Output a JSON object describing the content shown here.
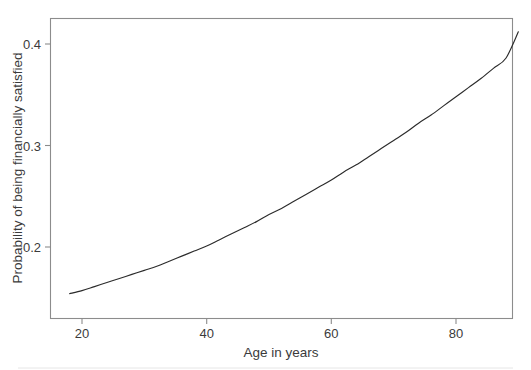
{
  "chart_data": {
    "type": "line",
    "title": "",
    "subtitle": "",
    "xlabel": "Age in years",
    "ylabel": "Probability of being financially satisfied",
    "xlim": [
      15,
      92
    ],
    "ylim": [
      0.143,
      0.427
    ],
    "xticks": [
      20,
      40,
      60,
      80
    ],
    "xtick_labels": [
      "20",
      "40",
      "60",
      "80"
    ],
    "yticks": [
      0.2,
      0.3,
      0.4
    ],
    "ytick_labels": [
      "0.2",
      "0.3",
      "0.4"
    ],
    "grid": false,
    "legend": null,
    "legend_position": "none",
    "annotations": [],
    "series": [
      {
        "name": "Predicted probability",
        "color": "#2b2b2b",
        "x": [
          18,
          20,
          22,
          24,
          26,
          28,
          30,
          32,
          34,
          36,
          38,
          40,
          42,
          44,
          46,
          48,
          50,
          52,
          54,
          56,
          58,
          60,
          62,
          64,
          66,
          68,
          70,
          72,
          74,
          76,
          78,
          80,
          82,
          84,
          86,
          88,
          90
        ],
        "y": [
          0.154,
          0.157,
          0.161,
          0.165,
          0.169,
          0.173,
          0.177,
          0.181,
          0.186,
          0.191,
          0.196,
          0.201,
          0.207,
          0.213,
          0.219,
          0.225,
          0.232,
          0.238,
          0.245,
          0.252,
          0.259,
          0.266,
          0.274,
          0.281,
          0.289,
          0.297,
          0.305,
          0.313,
          0.322,
          0.33,
          0.339,
          0.348,
          0.357,
          0.366,
          0.376,
          0.386,
          0.412
        ]
      }
    ]
  },
  "axes": {
    "x_axis_title": "Age in years",
    "y_axis_title": "Probability of being financially satisfied",
    "x_tick_0": "20",
    "x_tick_1": "40",
    "x_tick_2": "60",
    "x_tick_3": "80",
    "y_tick_0": "0.2",
    "y_tick_1": "0.3",
    "y_tick_2": "0.4"
  },
  "colors": {
    "curve": "#2b2b2b",
    "frame": "#8c8c8c",
    "text": "#3b3b3b",
    "background": "#ffffff"
  }
}
